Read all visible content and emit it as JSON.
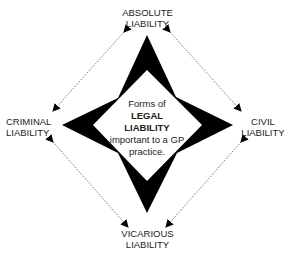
{
  "center": {
    "line1": "Forms of",
    "line2": "LEGAL",
    "line3": "LIABILITY",
    "line4": "important to a GP",
    "line5": "practice."
  },
  "nodes": {
    "top": {
      "line1": "ABSOLUTE",
      "line2": "LIABILITY"
    },
    "left": {
      "line1": "CRIMINAL",
      "line2": "LIABILITY"
    },
    "right": {
      "line1": "CIVIL",
      "line2": "LIABILITY"
    },
    "bottom": {
      "line1": "VICARIOUS",
      "line2": "LIABILITY"
    }
  },
  "connectors": [
    {
      "from": "ABSOLUTE LIABILITY",
      "to": "CRIMINAL LIABILITY",
      "style": "dotted-double-arrow"
    },
    {
      "from": "ABSOLUTE LIABILITY",
      "to": "CIVIL LIABILITY",
      "style": "dotted-double-arrow"
    },
    {
      "from": "CRIMINAL LIABILITY",
      "to": "VICARIOUS LIABILITY",
      "style": "dotted-double-arrow"
    },
    {
      "from": "CIVIL LIABILITY",
      "to": "VICARIOUS LIABILITY",
      "style": "dotted-double-arrow"
    }
  ],
  "colors": {
    "star": "#000000",
    "background": "#ffffff",
    "connector": "#555555",
    "text": "#222222"
  }
}
